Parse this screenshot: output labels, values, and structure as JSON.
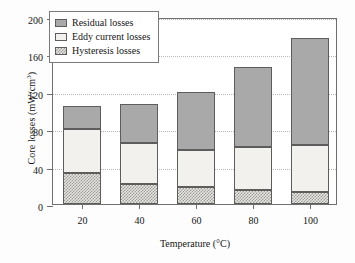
{
  "chart_data": {
    "type": "bar",
    "subtype": "stacked-bar",
    "title": "",
    "xlabel": "Temperature (°C)",
    "ylabel": "Core losses (mW/cm³)",
    "ylabel_main": "Core losses (mW/cm",
    "ylabel_sup": "3",
    "ylabel_tail": ")",
    "categories": [
      "20",
      "40",
      "60",
      "80",
      "100"
    ],
    "x": [
      20,
      40,
      60,
      80,
      100
    ],
    "series": [
      {
        "name": "Hysteresis losses",
        "values": [
          33,
          21,
          18,
          15,
          13
        ]
      },
      {
        "name": "Eddy current losses",
        "values": [
          47,
          44,
          40,
          46,
          50
        ]
      },
      {
        "name": "Residual losses",
        "values": [
          25,
          42,
          62,
          86,
          115
        ]
      }
    ],
    "cumulative_tops": [
      {
        "hysteresis": 33,
        "eddy": 80,
        "total": 105
      },
      {
        "hysteresis": 21,
        "eddy": 65,
        "total": 107
      },
      {
        "hysteresis": 18,
        "eddy": 58,
        "total": 120
      },
      {
        "hysteresis": 15,
        "eddy": 61,
        "total": 147
      },
      {
        "hysteresis": 13,
        "eddy": 63,
        "total": 178
      }
    ],
    "ylim": [
      0,
      200
    ],
    "yticks": [
      0,
      40,
      80,
      120,
      160,
      200
    ],
    "ytick_labels": [
      "0",
      "40",
      "80",
      "120",
      "160",
      "200"
    ],
    "grid": true,
    "grid_axis": "y",
    "grid_style": "dotted",
    "legend_position": "upper left",
    "stack_order": [
      "Hysteresis losses",
      "Eddy current losses",
      "Residual losses"
    ],
    "colors": {
      "residual": "#a9a9a9",
      "eddy": "#f2f1ee",
      "hysteresis": "#e6e4e0",
      "hysteresis_pattern": "#9e9c98",
      "outline": "#5d5d5d",
      "frame": "#6f6f6f",
      "gridline": "#b9b9b9",
      "text": "#151515",
      "background": "#ffffff"
    }
  },
  "legend": {
    "items": [
      {
        "label": "Residual losses",
        "swatch": "solid-gray-swatch"
      },
      {
        "label": "Eddy current losses",
        "swatch": "white-swatch"
      },
      {
        "label": "Hysteresis losses",
        "swatch": "checkered-swatch"
      }
    ]
  }
}
